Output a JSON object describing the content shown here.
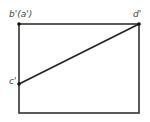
{
  "diagram": {
    "type": "orthographic-projection",
    "frame": {
      "x": 19,
      "y": 24,
      "width": 120,
      "height": 89,
      "stroke": "#333333"
    },
    "points": [
      {
        "id": "b_a",
        "label": "b'(a')",
        "x": 19,
        "y": 24
      },
      {
        "id": "d",
        "label": "d'",
        "x": 139,
        "y": 24
      },
      {
        "id": "c",
        "label": "c'",
        "x": 19,
        "y": 84
      }
    ],
    "segments": [
      {
        "from": "c",
        "to": "d"
      }
    ],
    "colors": {
      "line": "#222222",
      "label": "#444444",
      "background": "#ffffff"
    }
  }
}
